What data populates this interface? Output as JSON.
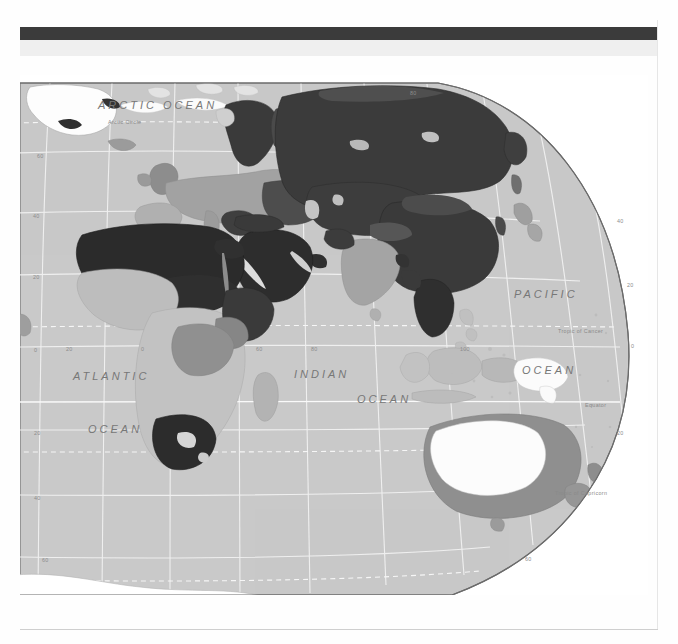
{
  "page": {
    "background": "#fefefe",
    "header_band_color": "#3b3b3b",
    "header_subband_color": "#efefef",
    "header_title": ""
  },
  "map": {
    "projection": "interrupted oval / Robinson-like hemisphere",
    "extent": "Eastern Hemisphere — Europe, Africa, Asia, Australia, Antarctica",
    "ocean_fill": "#c9c9c9",
    "graticule_color": "#f0f0f0",
    "border_color": "#6b6b6b",
    "ocean_labels": [
      {
        "text": "ARCTIC  OCEAN",
        "x": 78,
        "y": 24,
        "size": "big"
      },
      {
        "text": "ATLANTIC",
        "x": 53,
        "y": 295,
        "size": "big"
      },
      {
        "text": "OCEAN",
        "x": 68,
        "y": 348,
        "size": "big"
      },
      {
        "text": "INDIAN",
        "x": 274,
        "y": 293,
        "size": "big"
      },
      {
        "text": "OCEAN",
        "x": 337,
        "y": 318,
        "size": "big"
      },
      {
        "text": "PACIFIC",
        "x": 494,
        "y": 213,
        "size": "big"
      },
      {
        "text": "OCEAN",
        "x": 502,
        "y": 289,
        "size": "big"
      }
    ],
    "reference_lines": [
      {
        "text": "Arctic Circle",
        "x": 88,
        "y": 44
      },
      {
        "text": "Tropic of Cancer",
        "x": 538,
        "y": 253
      },
      {
        "text": "Equator",
        "x": 565,
        "y": 327
      },
      {
        "text": "Tropic of Capricorn",
        "x": 535,
        "y": 415
      },
      {
        "text": "Antarctic Circle",
        "x": 432,
        "y": 537
      }
    ],
    "latitude_labels": [
      {
        "text": "60",
        "x": 17,
        "y": 78
      },
      {
        "text": "40",
        "x": 13,
        "y": 138
      },
      {
        "text": "20",
        "x": 13,
        "y": 199
      },
      {
        "text": "0",
        "x": 14,
        "y": 272
      },
      {
        "text": "20",
        "x": 14,
        "y": 355
      },
      {
        "text": "40",
        "x": 14,
        "y": 420
      },
      {
        "text": "60",
        "x": 22,
        "y": 482
      },
      {
        "text": "40",
        "x": 597,
        "y": 143
      },
      {
        "text": "20",
        "x": 607,
        "y": 207
      },
      {
        "text": "0",
        "x": 611,
        "y": 268
      },
      {
        "text": "20",
        "x": 597,
        "y": 355
      },
      {
        "text": "60",
        "x": 505,
        "y": 481
      }
    ],
    "longitude_labels": [
      {
        "text": "80",
        "x": 390,
        "y": 15
      },
      {
        "text": "20",
        "x": 46,
        "y": 271
      },
      {
        "text": "0",
        "x": 121,
        "y": 271
      },
      {
        "text": "60",
        "x": 236,
        "y": 271
      },
      {
        "text": "80",
        "x": 291,
        "y": 271
      },
      {
        "text": "100",
        "x": 440,
        "y": 271
      }
    ]
  },
  "legend_shades": {
    "darkest": "#2f2f2f",
    "dark": "#555555",
    "medium": "#8e8e8e",
    "light": "#b4b4b4",
    "lightest": "#f4f4f4",
    "ocean": "#c9c9c9"
  },
  "footer": {
    "rule_color": "#cfcfcf"
  }
}
